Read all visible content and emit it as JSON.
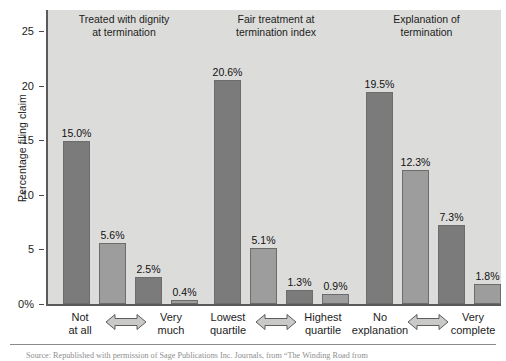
{
  "chart_data": {
    "type": "bar",
    "title": "",
    "xlabel": "",
    "ylabel": "Percentage filing claim",
    "ylim": [
      0,
      27
    ],
    "ytick_labels": [
      "0%",
      "5",
      "10",
      "15",
      "20",
      "25"
    ],
    "ytick_values": [
      0,
      5,
      10,
      15,
      20,
      25
    ],
    "grid": false,
    "legend": "none",
    "groups": [
      {
        "heading": "Treated with dignity\nat termination",
        "heading_line1": "Treated with dignity",
        "heading_line2": "at termination",
        "left_label_line1": "Not",
        "left_label_line2": "at all",
        "right_label_line1": "Very",
        "right_label_line2": "much",
        "values": [
          15.0,
          5.6,
          2.5,
          0.4
        ],
        "value_labels": [
          "15.0%",
          "5.6%",
          "2.5%",
          "0.4%"
        ]
      },
      {
        "heading": "Fair treatment at\ntermination index",
        "heading_line1": "Fair treatment at",
        "heading_line2": "termination index",
        "left_label_line1": "Lowest",
        "left_label_line2": "quartile",
        "right_label_line1": "Highest",
        "right_label_line2": "quartile",
        "values": [
          20.6,
          5.1,
          1.3,
          0.9
        ],
        "value_labels": [
          "20.6%",
          "5.1%",
          "1.3%",
          "0.9%"
        ]
      },
      {
        "heading": "Explanation of\ntermination",
        "heading_line1": "Explanation of",
        "heading_line2": "termination",
        "left_label_line1": "No",
        "left_label_line2": "explanation",
        "right_label_line1": "Very",
        "right_label_line2": "complete",
        "values": [
          19.5,
          12.3,
          7.3,
          1.8
        ],
        "value_labels": [
          "19.5%",
          "12.3%",
          "7.3%",
          "1.8%"
        ]
      }
    ]
  },
  "footer": {
    "source": "Source: Republished with permission of Sage Publications Inc. Journals, from “The Winding Road from"
  },
  "colors": {
    "plot_background": "#dcdcda",
    "bar_dark": "#7b7b7b",
    "bar_light": "#9d9d9d",
    "bar_border": "#6c6c6c",
    "axis": "#5a5a5a",
    "text": "#1c1c1c",
    "source_text": "#8e8e8e",
    "page_background": "#ffffff"
  }
}
